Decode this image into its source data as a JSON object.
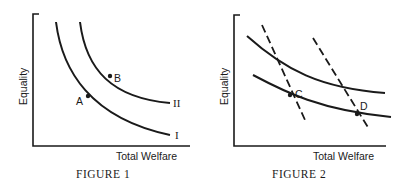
{
  "figures": [
    {
      "caption": "FIGURE 1",
      "x_axis_label": "Total Welfare",
      "y_axis_label": "Equality",
      "curves": [
        {
          "label": "I",
          "style": "solid"
        },
        {
          "label": "II",
          "style": "solid"
        }
      ],
      "points": [
        {
          "label": "A",
          "on_curve": "I"
        },
        {
          "label": "B",
          "on_curve": "II"
        }
      ]
    },
    {
      "caption": "FIGURE 2",
      "x_axis_label": "Total Welfare",
      "y_axis_label": "Equality",
      "curves": [
        {
          "label": "upper indifference curve",
          "style": "solid"
        },
        {
          "label": "lower indifference curve",
          "style": "solid"
        },
        {
          "label": "left trade-off line",
          "style": "dashed"
        },
        {
          "label": "right trade-off line",
          "style": "dashed"
        }
      ],
      "points": [
        {
          "label": "C"
        },
        {
          "label": "D"
        }
      ]
    }
  ],
  "colors": {
    "ink": "#1a1a1a",
    "background": "#ffffff"
  }
}
